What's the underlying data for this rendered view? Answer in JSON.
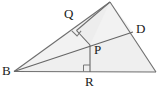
{
  "figure": {
    "canvas": {
      "width": 161,
      "height": 103
    },
    "colors": {
      "fill": "#efefef",
      "fill_upper": "#f4f4f4",
      "stroke": "#6e6e6e",
      "stroke_dark": "#555555",
      "label": "#1a1a1a",
      "background": "#ffffff"
    },
    "stroke_width": 1,
    "points": {
      "B": {
        "x": 14,
        "y": 71.5,
        "label": "B",
        "label_x": 2,
        "label_y": 65
      },
      "A": {
        "x": 110,
        "y": 2,
        "label": "",
        "label_x": 0,
        "label_y": 0
      },
      "C": {
        "x": 156,
        "y": 72,
        "label": "",
        "label_x": 0,
        "label_y": 0
      },
      "D": {
        "x": 133,
        "y": 32,
        "label": "D",
        "label_x": 136,
        "label_y": 23
      },
      "P": {
        "x": 90,
        "y": 45,
        "label": "P",
        "label_x": 94,
        "label_y": 43
      },
      "Q": {
        "x": 76.5,
        "y": 30.5,
        "label": "Q",
        "label_x": 64,
        "label_y": 7
      },
      "R": {
        "x": 90,
        "y": 72,
        "label": "R",
        "label_x": 85,
        "label_y": 75
      }
    },
    "segments": [
      {
        "name": "side-BA",
        "from": "B",
        "to": "A"
      },
      {
        "name": "side-AC",
        "from": "A",
        "to": "C"
      },
      {
        "name": "side-BC",
        "from": "B",
        "to": "C"
      },
      {
        "name": "cevian-BD",
        "from": "B",
        "to": "D"
      },
      {
        "name": "perpendicular-PQ",
        "from": "P",
        "to": "Q"
      },
      {
        "name": "perpendicular-PR",
        "from": "P",
        "to": "R"
      },
      {
        "name": "segment-QA",
        "from": "Q",
        "to": "A"
      }
    ],
    "right_angles": [
      {
        "name": "right-angle-at-Q",
        "at": "Q"
      },
      {
        "name": "right-angle-at-R",
        "at": "R"
      }
    ]
  }
}
